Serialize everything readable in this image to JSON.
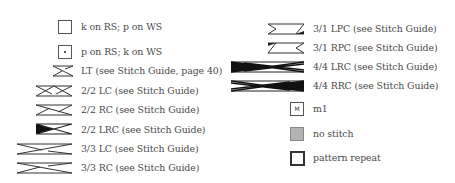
{
  "legend": {
    "left_column": [
      {
        "symbol": "empty-square",
        "label": "k on RS; p on WS"
      },
      {
        "symbol": "dot-square",
        "label": "p on RS; k on WS"
      },
      {
        "symbol": "lt-cross",
        "label": "LT (see Stitch Guide, page 40)"
      },
      {
        "symbol": "lc-2-2",
        "label": "2/2 LC (see Stitch Guide)"
      },
      {
        "symbol": "rc-2-2",
        "label": "2/2 RC (see Stitch Guide)"
      },
      {
        "symbol": "lrc-2-2",
        "label": "2/2 LRC (see Stitch Guide)"
      },
      {
        "symbol": "lc-3-3",
        "label": "3/3 LC (see Stitch Guide)"
      },
      {
        "symbol": "rc-3-3",
        "label": "3/3 RC (see Stitch Guide)"
      }
    ],
    "right_column": [
      {
        "symbol": "lpc-3-1",
        "label": "3/1 LPC (see Stitch Guide)"
      },
      {
        "symbol": "rpc-3-1",
        "label": "3/1 RPC (see Stitch Guide)"
      },
      {
        "symbol": "lrc-4-4",
        "label": "4/4 LRC (see Stitch Guide)"
      },
      {
        "symbol": "rrc-4-4",
        "label": "4/4 RRC (see Stitch Guide)"
      },
      {
        "symbol": "m1-square",
        "label": "m1",
        "glyph": "M"
      },
      {
        "symbol": "no-stitch-square",
        "label": "no stitch",
        "color": "#b3b3b3"
      },
      {
        "symbol": "pattern-repeat-square",
        "label": "pattern repeat"
      }
    ]
  }
}
